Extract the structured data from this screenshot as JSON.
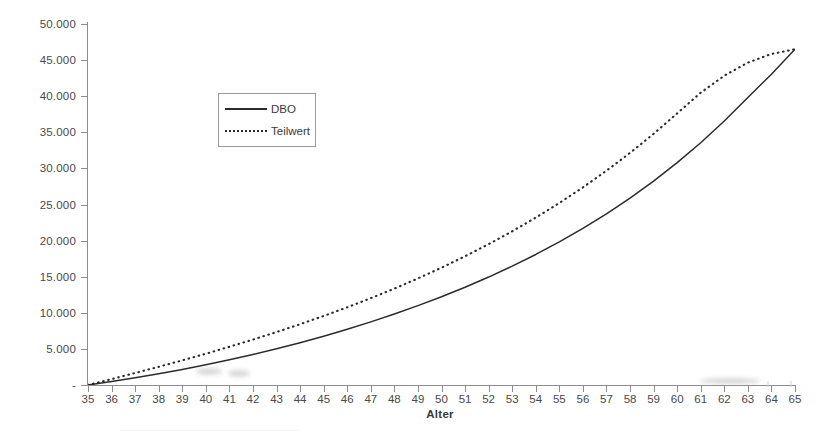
{
  "chart_data": {
    "type": "line",
    "title": "",
    "xlabel": "Alter",
    "ylabel": "",
    "xlim": [
      35,
      65
    ],
    "ylim": [
      0,
      50000
    ],
    "grid": false,
    "legend_position": "upper-left-center",
    "x": [
      35,
      36,
      37,
      38,
      39,
      40,
      41,
      42,
      43,
      44,
      45,
      46,
      47,
      48,
      49,
      50,
      51,
      52,
      53,
      54,
      55,
      56,
      57,
      58,
      59,
      60,
      61,
      62,
      63,
      64,
      65
    ],
    "xtick_labels": [
      "35",
      "36",
      "37",
      "38",
      "39",
      "40",
      "41",
      "42",
      "43",
      "44",
      "45",
      "46",
      "47",
      "48",
      "49",
      "50",
      "51",
      "52",
      "53",
      "54",
      "55",
      "56",
      "57",
      "58",
      "59",
      "60",
      "61",
      "62",
      "63",
      "64",
      "65"
    ],
    "ytick_values": [
      0,
      5000,
      10000,
      15000,
      20000,
      25000,
      30000,
      35000,
      40000,
      45000,
      50000
    ],
    "ytick_labels": [
      "-",
      "5.000",
      "10.000",
      "15.000",
      "20.000",
      "25.000",
      "30.000",
      "35.000",
      "40.000",
      "45.000",
      "50.000"
    ],
    "series": [
      {
        "name": "DBO",
        "style": "solid",
        "color": "#2b2b2b",
        "values": [
          0,
          480,
          1000,
          1560,
          2160,
          2800,
          3490,
          4230,
          5020,
          5860,
          6760,
          7720,
          8740,
          9830,
          10990,
          12220,
          13540,
          14950,
          16460,
          18080,
          19820,
          21690,
          23710,
          25890,
          28250,
          30800,
          33560,
          36560,
          39820,
          43050,
          46500
        ]
      },
      {
        "name": "Teilwert",
        "style": "dotted",
        "color": "#2b2b2b",
        "values": [
          0,
          820,
          1660,
          2520,
          3410,
          4330,
          5290,
          6290,
          7330,
          8420,
          9560,
          10760,
          12020,
          13350,
          14760,
          16250,
          17830,
          19510,
          21290,
          23190,
          25210,
          27370,
          29680,
          32150,
          34790,
          37620,
          40490,
          42840,
          44650,
          45850,
          46500
        ]
      }
    ]
  },
  "legend": {
    "items": [
      {
        "label": "DBO",
        "sample": "solid-line-sample"
      },
      {
        "label": "Teilwert",
        "sample": "dotted-line-sample"
      }
    ]
  },
  "axis": {
    "x_title": "Alter"
  }
}
